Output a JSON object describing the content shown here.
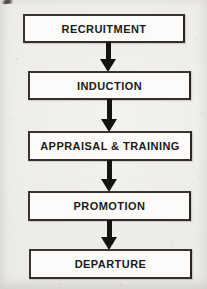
{
  "diagram": {
    "type": "flowchart",
    "direction": "top-down",
    "steps": [
      {
        "label": "RECRUITMENT"
      },
      {
        "label": "INDUCTION"
      },
      {
        "label": "APPRAISAL & TRAINING"
      },
      {
        "label": "PROMOTION"
      },
      {
        "label": "DEPARTURE"
      }
    ],
    "connector": "solid-black-down-arrow",
    "connector_count": 4
  },
  "colors": {
    "background": "#ecebe7",
    "box_fill": "#fcfbf9",
    "box_border": "#38342f",
    "text": "#1c1b19",
    "arrow": "#141310"
  },
  "artifacts": {
    "top_left_smudge": "small dark scan mark at top-left corner"
  }
}
